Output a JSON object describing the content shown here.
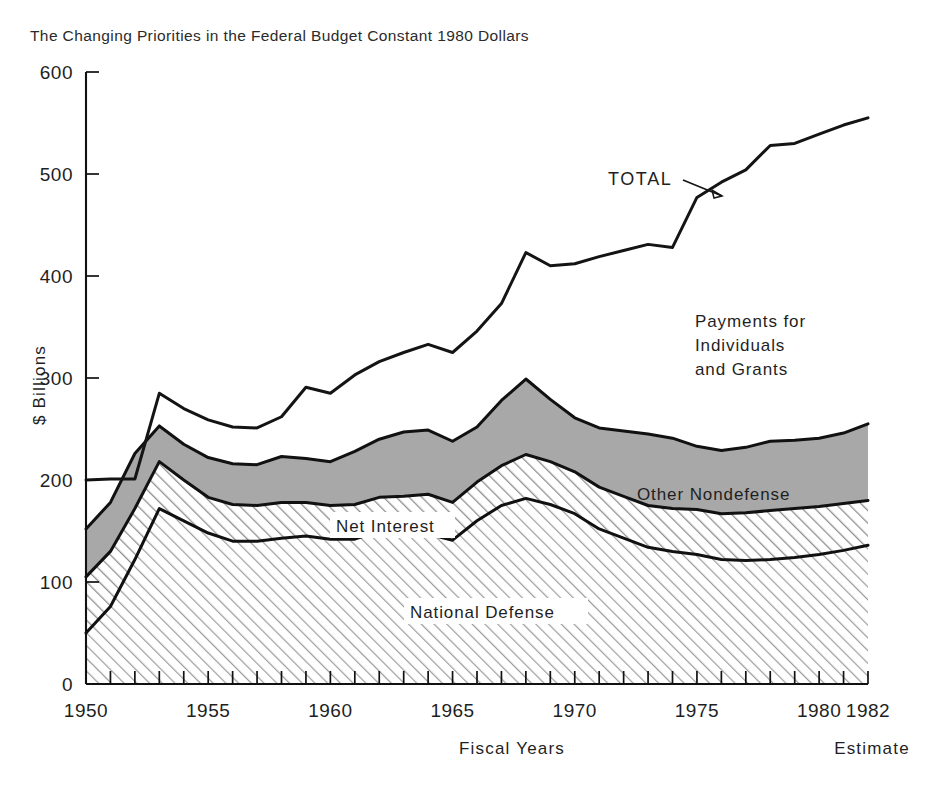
{
  "header": {
    "title": "The Changing Priorities in the Federal Budget Constant 1980 Dollars"
  },
  "axes": {
    "y_label": "$ Billions",
    "x_label": "Fiscal Years",
    "estimate_note": "Estimate",
    "y_ticks": [
      "0",
      "100",
      "200",
      "300",
      "400",
      "500",
      "600"
    ],
    "x_ticks": [
      "1950",
      "1955",
      "1960",
      "1965",
      "1970",
      "1975",
      "1980",
      "1982"
    ]
  },
  "annotations": {
    "total": "TOTAL",
    "payments": [
      "Payments for",
      "Individuals",
      "and Grants"
    ],
    "other_nondefense": "Other Nondefense",
    "net_interest": "Net Interest",
    "national_defense": "National Defense"
  },
  "colors": {
    "ink": "#141414",
    "gray_band": "#a8a8a8",
    "hatch": "#9a9a9a",
    "background": "#ffffff"
  },
  "chart_data": {
    "type": "area",
    "title": "The Changing Priorities in the Federal Budget Constant 1980 Dollars",
    "xlabel": "Fiscal Years",
    "ylabel": "$ Billions",
    "xlim": [
      1950,
      1982
    ],
    "ylim": [
      0,
      600
    ],
    "y_ticks": [
      0,
      100,
      200,
      300,
      400,
      500,
      600
    ],
    "x_tick_labels": [
      1950,
      1955,
      1960,
      1965,
      1970,
      1975,
      1980,
      1982
    ],
    "x_minor_tick_interval": 1,
    "grid": false,
    "legend": "inline-annotations",
    "stacked": true,
    "units": "Billions of constant 1980 dollars",
    "x": [
      1950,
      1951,
      1952,
      1953,
      1954,
      1955,
      1956,
      1957,
      1958,
      1959,
      1960,
      1961,
      1962,
      1963,
      1964,
      1965,
      1966,
      1967,
      1968,
      1969,
      1970,
      1971,
      1972,
      1973,
      1974,
      1975,
      1976,
      1977,
      1978,
      1979,
      1980,
      1981,
      1982
    ],
    "series": [
      {
        "name": "National Defense",
        "fill": "hatch-45",
        "values": [
          50,
          76,
          122,
          172,
          160,
          148,
          140,
          140,
          143,
          145,
          142,
          142,
          150,
          150,
          147,
          141,
          160,
          175,
          182,
          176,
          167,
          152,
          143,
          134,
          130,
          127,
          122,
          121,
          122,
          124,
          127,
          131,
          136
        ]
      },
      {
        "name": "Net Interest",
        "fill": "hatch-45",
        "cumulative_top": [
          105,
          130,
          172,
          218,
          200,
          183,
          176,
          175,
          178,
          178,
          175,
          176,
          183,
          184,
          186,
          178,
          198,
          214,
          225,
          218,
          208,
          193,
          184,
          175,
          172,
          171,
          167,
          168,
          170,
          172,
          174,
          177,
          180
        ]
      },
      {
        "name": "Other Nondefense",
        "fill": "solid-gray",
        "cumulative_top": [
          152,
          178,
          226,
          253,
          235,
          222,
          216,
          215,
          223,
          221,
          218,
          228,
          240,
          247,
          249,
          238,
          252,
          278,
          299,
          279,
          261,
          251,
          248,
          245,
          241,
          233,
          229,
          232,
          238,
          239,
          241,
          246,
          255
        ]
      },
      {
        "name": "Payments for Individuals and Grants",
        "fill": "white",
        "cumulative_top": [
          200,
          201,
          201,
          285,
          270,
          259,
          252,
          251,
          262,
          291,
          285,
          303,
          316,
          325,
          333,
          325,
          346,
          373,
          423,
          410,
          412,
          419,
          425,
          431,
          428,
          477,
          492,
          504,
          528,
          530,
          539,
          548,
          555
        ]
      }
    ],
    "total_line": {
      "name": "TOTAL",
      "values": [
        200,
        201,
        201,
        285,
        270,
        259,
        252,
        251,
        262,
        291,
        285,
        303,
        316,
        325,
        333,
        325,
        346,
        373,
        423,
        410,
        412,
        419,
        425,
        431,
        428,
        477,
        492,
        504,
        528,
        530,
        539,
        548,
        555
      ]
    }
  }
}
